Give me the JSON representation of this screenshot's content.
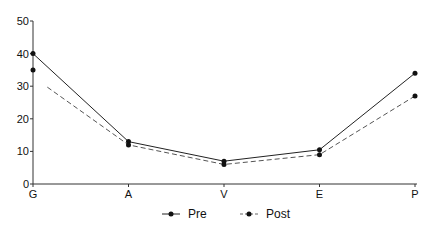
{
  "chart_data": {
    "type": "line",
    "title": "",
    "xlabel": "",
    "ylabel": "",
    "categories": [
      "G",
      "A",
      "V",
      "E",
      "P"
    ],
    "series": [
      {
        "name": "Pre",
        "values": [
          40,
          13,
          7,
          10.5,
          34
        ],
        "style": "solid",
        "color": "#222222"
      },
      {
        "name": "Post",
        "values": [
          35,
          12,
          6,
          9,
          27
        ],
        "style": "dashed",
        "color": "#555555"
      }
    ],
    "ylim": [
      0,
      50
    ],
    "yticks": [
      0,
      10,
      20,
      30,
      40,
      50
    ],
    "grid": false,
    "legend_position": "bottom"
  },
  "legend": {
    "items": [
      {
        "label": "Pre"
      },
      {
        "label": "Post"
      }
    ]
  }
}
